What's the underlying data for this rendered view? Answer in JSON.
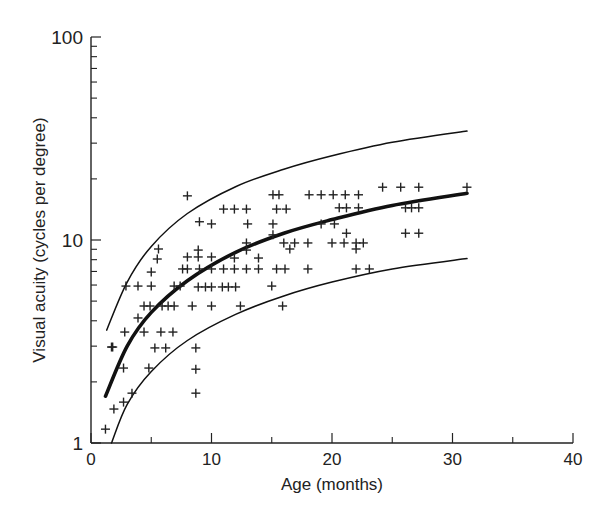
{
  "chart_data": {
    "type": "scatter",
    "title": "",
    "xlabel": "Age (months)",
    "ylabel": "Visual acuity (cycles per degree)",
    "xlim": [
      0,
      40
    ],
    "ylim": [
      1,
      100
    ],
    "yscale": "log",
    "grid": false,
    "x_ticks": [
      0,
      10,
      20,
      30,
      40
    ],
    "x_tick_labels": [
      "0",
      "10",
      "20",
      "30",
      "40"
    ],
    "x_minor_ticks": [
      5,
      15,
      25,
      35
    ],
    "y_ticks": [
      1,
      10,
      100
    ],
    "y_tick_labels": [
      "1",
      "10",
      "100"
    ],
    "y_minor_ticks": [
      2,
      3,
      4,
      5,
      6,
      7,
      8,
      9,
      20,
      30,
      40,
      50,
      60,
      70,
      80,
      90
    ],
    "marker": "+",
    "points": [
      [
        1.2,
        1.17
      ],
      [
        1.9,
        1.47
      ],
      [
        2.7,
        1.59
      ],
      [
        3.4,
        1.76
      ],
      [
        2.7,
        2.34
      ],
      [
        4.8,
        2.34
      ],
      [
        1.7,
        2.97
      ],
      [
        1.8,
        2.97
      ],
      [
        5.3,
        2.94
      ],
      [
        6.2,
        2.94
      ],
      [
        8.7,
        2.94
      ],
      [
        8.7,
        2.31
      ],
      [
        8.7,
        1.76
      ],
      [
        2.8,
        3.52
      ],
      [
        4.4,
        3.52
      ],
      [
        5.8,
        3.52
      ],
      [
        6.8,
        3.52
      ],
      [
        3.9,
        4.13
      ],
      [
        4.4,
        4.73
      ],
      [
        4.9,
        4.73
      ],
      [
        5.9,
        4.73
      ],
      [
        6.4,
        4.73
      ],
      [
        6.9,
        4.73
      ],
      [
        8.4,
        4.73
      ],
      [
        10.0,
        4.73
      ],
      [
        12.4,
        4.73
      ],
      [
        15.9,
        4.73
      ],
      [
        2.9,
        5.93
      ],
      [
        3.9,
        5.93
      ],
      [
        5.0,
        5.93
      ],
      [
        6.9,
        5.93
      ],
      [
        7.4,
        5.93
      ],
      [
        8.9,
        5.87
      ],
      [
        9.5,
        5.87
      ],
      [
        10.0,
        5.87
      ],
      [
        10.9,
        5.87
      ],
      [
        11.4,
        5.87
      ],
      [
        12.0,
        5.87
      ],
      [
        15.0,
        5.93
      ],
      [
        5.0,
        6.95
      ],
      [
        7.6,
        7.2
      ],
      [
        8.0,
        7.2
      ],
      [
        9.0,
        7.2
      ],
      [
        10.0,
        7.2
      ],
      [
        11.0,
        7.2
      ],
      [
        11.9,
        7.2
      ],
      [
        12.9,
        7.2
      ],
      [
        13.9,
        7.2
      ],
      [
        15.4,
        7.2
      ],
      [
        16.1,
        7.2
      ],
      [
        18.0,
        7.2
      ],
      [
        22.0,
        7.2
      ],
      [
        23.1,
        7.2
      ],
      [
        5.6,
        9.03
      ],
      [
        5.5,
        8.06
      ],
      [
        8.0,
        8.25
      ],
      [
        8.9,
        8.92
      ],
      [
        8.9,
        8.25
      ],
      [
        10.0,
        8.25
      ],
      [
        11.9,
        8.15
      ],
      [
        13.9,
        8.15
      ],
      [
        12.9,
        8.92
      ],
      [
        12.9,
        9.67
      ],
      [
        16.5,
        9.03
      ],
      [
        15.1,
        10.6
      ],
      [
        16.0,
        9.67
      ],
      [
        16.9,
        9.67
      ],
      [
        18.0,
        9.67
      ],
      [
        20.0,
        9.67
      ],
      [
        21.0,
        9.67
      ],
      [
        22.0,
        9.67
      ],
      [
        22.6,
        9.67
      ],
      [
        22.0,
        9.03
      ],
      [
        26.1,
        10.8
      ],
      [
        27.2,
        10.8
      ],
      [
        21.2,
        10.8
      ],
      [
        19.1,
        12.0
      ],
      [
        20.2,
        12.0
      ],
      [
        9.0,
        12.3
      ],
      [
        10.0,
        12.0
      ],
      [
        13.0,
        12.0
      ],
      [
        15.1,
        12.0
      ],
      [
        20.6,
        14.4
      ],
      [
        21.2,
        14.4
      ],
      [
        22.2,
        14.4
      ],
      [
        11.0,
        14.2
      ],
      [
        11.9,
        14.2
      ],
      [
        12.9,
        14.2
      ],
      [
        15.4,
        14.2
      ],
      [
        16.2,
        14.2
      ],
      [
        26.1,
        14.4
      ],
      [
        26.6,
        14.4
      ],
      [
        27.2,
        14.4
      ],
      [
        8.0,
        16.5
      ],
      [
        15.1,
        16.7
      ],
      [
        15.6,
        16.7
      ],
      [
        18.1,
        16.7
      ],
      [
        19.1,
        16.7
      ],
      [
        20.1,
        16.7
      ],
      [
        21.1,
        16.7
      ],
      [
        22.2,
        16.7
      ],
      [
        24.2,
        18.2
      ],
      [
        25.7,
        18.2
      ],
      [
        27.2,
        18.2
      ],
      [
        31.2,
        18.2
      ]
    ],
    "curves": [
      {
        "name": "upper-bound",
        "style": "thin",
        "points": [
          [
            1.3,
            3.6
          ],
          [
            3,
            6.2
          ],
          [
            5,
            9.3
          ],
          [
            8,
            13.5
          ],
          [
            12,
            18.3
          ],
          [
            16,
            22.3
          ],
          [
            20,
            26.0
          ],
          [
            25,
            30.3
          ],
          [
            31.2,
            34.4
          ]
        ]
      },
      {
        "name": "mean-fit",
        "style": "thick",
        "points": [
          [
            1.2,
            1.7
          ],
          [
            3,
            3.0
          ],
          [
            5,
            4.4
          ],
          [
            8,
            6.3
          ],
          [
            12,
            8.7
          ],
          [
            16,
            10.8
          ],
          [
            20,
            12.6
          ],
          [
            25,
            14.8
          ],
          [
            31.2,
            17.0
          ]
        ]
      },
      {
        "name": "lower-bound",
        "style": "thin",
        "points": [
          [
            1.7,
            1.0
          ],
          [
            3,
            1.55
          ],
          [
            5,
            2.25
          ],
          [
            8,
            3.2
          ],
          [
            12,
            4.3
          ],
          [
            16,
            5.3
          ],
          [
            20,
            6.2
          ],
          [
            25,
            7.2
          ],
          [
            31.2,
            8.1
          ]
        ]
      }
    ]
  }
}
